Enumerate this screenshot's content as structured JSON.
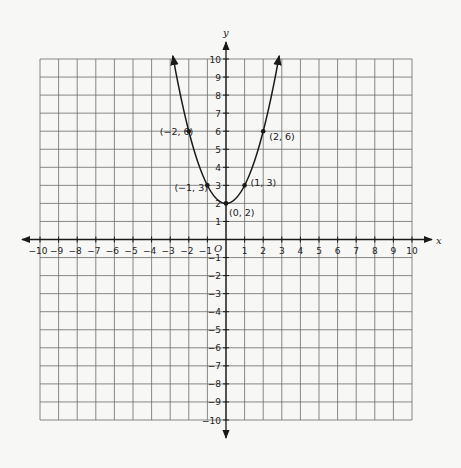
{
  "chart_data": {
    "type": "line",
    "title": "",
    "function": "y = x^2 + 2",
    "xlabel": "x",
    "ylabel": "y",
    "origin_label": "O",
    "xlim": [
      -10,
      10
    ],
    "ylim": [
      -10,
      10
    ],
    "grid": true,
    "x_ticks": [
      -10,
      -9,
      -8,
      -7,
      -6,
      -5,
      -4,
      -3,
      -2,
      -1,
      1,
      2,
      3,
      4,
      5,
      6,
      7,
      8,
      9,
      10
    ],
    "y_ticks": [
      -10,
      -9,
      -8,
      -7,
      -6,
      -5,
      -4,
      -3,
      -2,
      -1,
      1,
      2,
      3,
      4,
      5,
      6,
      7,
      8,
      9,
      10
    ],
    "x_tick_labels": [
      "−10",
      "−9",
      "−8",
      "−7",
      "−6",
      "−5",
      "−4",
      "−3",
      "−2",
      "−1",
      "1",
      "2",
      "3",
      "4",
      "5",
      "6",
      "7",
      "8",
      "9",
      "10"
    ],
    "y_tick_labels": [
      "−10",
      "−9",
      "−8",
      "−7",
      "−6",
      "−5",
      "−4",
      "−3",
      "−2",
      "−1",
      "1",
      "2",
      "3",
      "4",
      "5",
      "6",
      "7",
      "8",
      "9",
      "10"
    ],
    "series": [
      {
        "name": "parabola",
        "x": [
          -2.86,
          -2,
          -1,
          0,
          1,
          2,
          2.86
        ],
        "y": [
          10.2,
          6,
          3,
          2,
          3,
          6,
          10.2
        ],
        "arrows_at_ends": true,
        "color": "#1a1a1a"
      }
    ],
    "points": [
      {
        "x": -2,
        "y": 6,
        "label": "(−2, 6)"
      },
      {
        "x": -1,
        "y": 3,
        "label": "(−1, 3)"
      },
      {
        "x": 0,
        "y": 2,
        "label": "(0, 2)"
      },
      {
        "x": 1,
        "y": 3,
        "label": "(1, 3)"
      },
      {
        "x": 2,
        "y": 6,
        "label": "(2, 6)"
      }
    ]
  },
  "colors": {
    "grid": "#6b6b6b",
    "axis": "#1a1a1a",
    "curve": "#1a1a1a",
    "background": "#f7f7f5"
  }
}
